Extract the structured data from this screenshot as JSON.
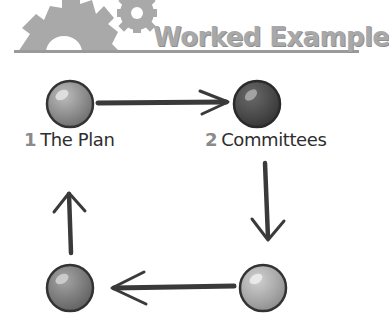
{
  "banner": {
    "title": "Worked Example",
    "icon": "gears-icon",
    "color": "#a8a8a8"
  },
  "diagram": {
    "type": "cycle",
    "nodes": [
      {
        "id": 1,
        "number": "1",
        "label": "The Plan",
        "shade": "#8c8c8c",
        "position": "top-left"
      },
      {
        "id": 2,
        "number": "2",
        "label": "Committees",
        "shade": "#4a4a4a",
        "position": "top-right"
      },
      {
        "id": 3,
        "number": "",
        "label": "",
        "shade": "#a8a8a8",
        "position": "bottom-right"
      },
      {
        "id": 4,
        "number": "",
        "label": "",
        "shade": "#7a7a7a",
        "position": "bottom-left"
      }
    ],
    "edges": [
      {
        "from": 1,
        "to": 2,
        "direction": "right"
      },
      {
        "from": 2,
        "to": 3,
        "direction": "down"
      },
      {
        "from": 3,
        "to": 4,
        "direction": "left"
      },
      {
        "from": 4,
        "to": 1,
        "direction": "up"
      }
    ],
    "number_color": "#8a8a8a",
    "text_color": "#2e2e2e",
    "arrow_color": "#3a3a3a"
  }
}
